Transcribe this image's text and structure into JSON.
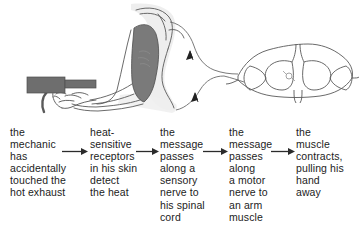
{
  "figure": {
    "colors": {
      "outline": "#555555",
      "muscle_fill": "#7a7a7a",
      "exhaust_fill": "#6e6e6e",
      "skin_shadow": "#e9e9e9",
      "text": "#1c1c1c",
      "arrow": "#2b2b2b"
    }
  },
  "diagram": {
    "parts": [
      {
        "name": "exhaust-pipe",
        "label": "hot exhaust pipe"
      },
      {
        "name": "hand",
        "label": "hand and fingers"
      },
      {
        "name": "forearm",
        "label": "forearm"
      },
      {
        "name": "upper-arm",
        "label": "upper arm"
      },
      {
        "name": "biceps-muscle",
        "label": "arm muscle"
      },
      {
        "name": "sensory-nerve",
        "label": "sensory nerve"
      },
      {
        "name": "motor-nerve",
        "label": "motor nerve"
      },
      {
        "name": "spinal-cord-cross-section",
        "label": "spinal cord"
      },
      {
        "name": "relay-neuron",
        "label": "relay neuron"
      }
    ],
    "nerve_arrow_count": 2
  },
  "flow": {
    "steps": [
      {
        "id": "step-1",
        "text": "the\nmechanic\nhas\naccidentally\ntouched the\nhot exhaust"
      },
      {
        "id": "step-2",
        "text": "heat-\nsensitive\nreceptors\nin his skin\ndetect\nthe heat"
      },
      {
        "id": "step-3",
        "text": "the\nmessage\npasses\nalong a\nsensory\nnerve to\nhis spinal\ncord"
      },
      {
        "id": "step-4",
        "text": "the\nmessage\npasses\nalong\na motor\nnerve to\nan arm\nmuscle"
      },
      {
        "id": "step-5",
        "text": "the\nmuscle\ncontracts,\npulling his\nhand\naway"
      }
    ],
    "arrows": [
      {
        "id": "arrow-1",
        "symbol": "right-arrow"
      },
      {
        "id": "arrow-2",
        "symbol": "right-arrow"
      },
      {
        "id": "arrow-3",
        "symbol": "right-arrow"
      },
      {
        "id": "arrow-4",
        "symbol": "right-arrow"
      }
    ]
  }
}
